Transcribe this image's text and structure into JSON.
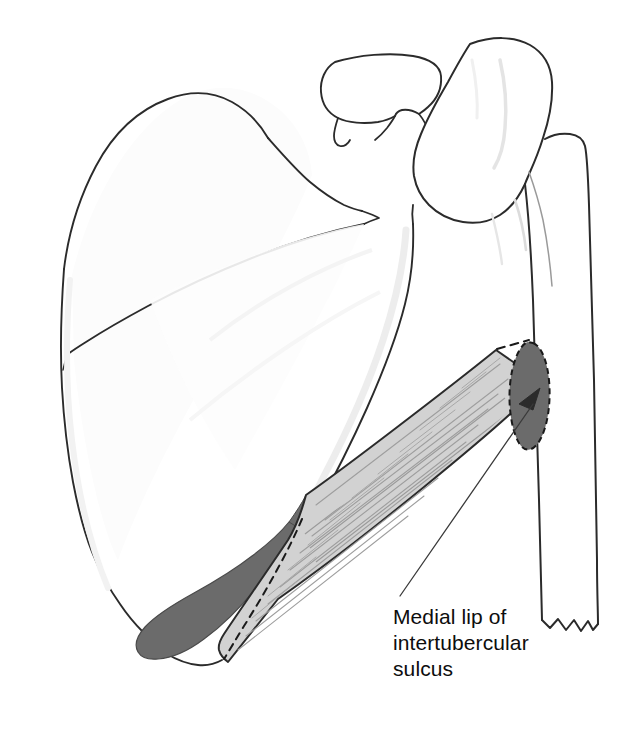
{
  "figure": {
    "name": "scapula-humerus-muscle-attachment",
    "view": "anterior view of left shoulder girdle",
    "background_color": "#ffffff",
    "width": 628,
    "height": 732
  },
  "colors": {
    "outline": "#2b2b2b",
    "faint_outline": "#8c8c8c",
    "attachment_dark": "#6b6b6b",
    "muscle_light": "#d2d2d2",
    "muscle_striation": "#9a9a9a",
    "label_text": "#0d0d0d",
    "leader_line": "#3a3a3a",
    "dashed_line": "#1a1a1a",
    "background": "#ffffff"
  },
  "labels": [
    {
      "id": "medial-lip-label",
      "lines": [
        "Medial lip of",
        "intertubercular",
        "sulcus"
      ],
      "line1": "Medial lip of",
      "line2": "intertubercular",
      "line3": "sulcus",
      "x": 393,
      "y": 604,
      "font_size_px": 21,
      "points_to": "insertion-attachment-mark"
    }
  ],
  "structures": [
    {
      "id": "scapula",
      "name": "scapula",
      "description": "large flat triangular bone occupying the left two thirds of the figure, outlined in thin dark line"
    },
    {
      "id": "scapular-spine",
      "name": "spine-of-scapula",
      "description": "ridge running diagonally across the upper scapula from medial border to acromion"
    },
    {
      "id": "acromion",
      "name": "acromion-process",
      "description": "flattened hook shaped process at the top center overlapping the humeral head"
    },
    {
      "id": "coracoid",
      "name": "coracoid-process",
      "description": "small beak like process medial to the humeral head"
    },
    {
      "id": "glenoid",
      "name": "glenoid-cavity-region",
      "description": "lateral angle of scapula articulating with the humeral head"
    },
    {
      "id": "humerus",
      "name": "humerus",
      "description": "long bone on the right side with rounded head above and a jagged cut shaft end below"
    },
    {
      "id": "humeral-head",
      "name": "humeral-head",
      "description": "rounded proximal end of the humerus at the top right"
    },
    {
      "id": "humerus-cut-end",
      "name": "humerus-cut-end",
      "description": "zigzag jagged line showing the shaft of the humerus has been cut transversely"
    }
  ],
  "attachments": [
    {
      "id": "origin-attachment-area",
      "name": "muscle-origin-area",
      "fill": "#6b6b6b",
      "location": "lateral border and inferior angle of the scapula",
      "description": "elongated dark gray band curving along the lower lateral edge of the scapula and around the inferior angle"
    },
    {
      "id": "insertion-attachment-mark",
      "name": "muscle-insertion-area",
      "fill": "#6b6b6b",
      "location": "medial lip of the intertubercular sulcus of the humerus",
      "outline_style": "dashed",
      "has_arrowhead": true,
      "description": "narrow elongated dark gray oval with a dashed border and an inward pointing arrowhead on the humeral shaft"
    }
  ],
  "muscle": {
    "id": "muscle-belly",
    "name": "muscle-belly",
    "fill": "#d2d2d2",
    "stroke": "#2b2b2b",
    "striations": true,
    "description": "broad flat band of muscle shaded light gray with fine parallel diagonal striation lines running from the scapular origin up to the humeral insertion",
    "dashed_border_edge": "tendinous boundary shown as a dashed line at the scapular end and continuing to the humeral insertion"
  },
  "annotations": {
    "dashed_connectors": "dashed lines link the upper and lower corners of the muscle band to the dark insertion mark on the humerus",
    "leader_line": "thin straight line from the label text up to the arrowhead on the insertion mark"
  }
}
